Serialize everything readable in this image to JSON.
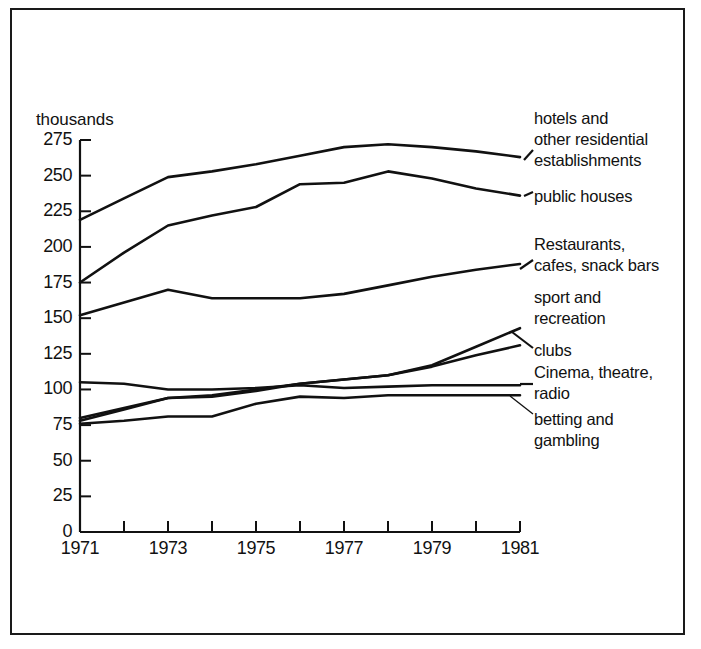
{
  "figure": {
    "axis_unit_label": "thousands",
    "line_color": "#111111",
    "background_color": "#ffffff",
    "frame_color": "#1a1a1a"
  },
  "axes": {
    "y_ticks": [
      "275",
      "250",
      "225",
      "200",
      "175",
      "150",
      "125",
      "100",
      "75",
      "50",
      "25",
      "0"
    ],
    "x_ticks_labeled": [
      "1971",
      "1973",
      "1975",
      "1977",
      "1979",
      "1981"
    ]
  },
  "series_labels": [
    {
      "id": "hotels",
      "lines": [
        "hotels and",
        "other residential",
        "establishments"
      ]
    },
    {
      "id": "public-houses",
      "lines": [
        "public houses"
      ]
    },
    {
      "id": "restaurants",
      "lines": [
        "Restaurants,",
        "cafes, snack bars"
      ]
    },
    {
      "id": "sport",
      "lines": [
        "sport and",
        "recreation"
      ]
    },
    {
      "id": "clubs",
      "lines": [
        "clubs"
      ]
    },
    {
      "id": "cinema",
      "lines": [
        "Cinema, theatre,",
        "radio"
      ]
    },
    {
      "id": "betting",
      "lines": [
        "betting and",
        "gambling"
      ]
    }
  ],
  "chart_data": {
    "type": "line",
    "title": "",
    "subtitle": "",
    "xlabel": "",
    "ylabel": "thousands",
    "x": [
      1971,
      1972,
      1973,
      1974,
      1975,
      1976,
      1977,
      1978,
      1979,
      1980,
      1981
    ],
    "xlim": [
      1971,
      1981
    ],
    "ylim": [
      0,
      275
    ],
    "y_ticks": [
      0,
      25,
      50,
      75,
      100,
      125,
      150,
      175,
      200,
      225,
      250,
      275
    ],
    "x_tick_labels": [
      "1971",
      "",
      "1973",
      "",
      "1975",
      "",
      "1977",
      "",
      "1979",
      "",
      "1981"
    ],
    "grid": false,
    "legend": "right-inline-labels",
    "series": [
      {
        "name": "hotels and other residential establishments",
        "values": [
          219,
          234,
          249,
          253,
          258,
          264,
          270,
          272,
          270,
          267,
          263
        ]
      },
      {
        "name": "public houses",
        "values": [
          175,
          196,
          215,
          222,
          228,
          244,
          245,
          253,
          248,
          241,
          236
        ]
      },
      {
        "name": "Restaurants, cafes, snack bars",
        "values": [
          152,
          161,
          170,
          164,
          164,
          164,
          167,
          173,
          179,
          184,
          188
        ]
      },
      {
        "name": "sport and recreation",
        "values": [
          80,
          87,
          94,
          96,
          100,
          104,
          107,
          110,
          117,
          130,
          143
        ]
      },
      {
        "name": "clubs",
        "values": [
          78,
          86,
          94,
          95,
          99,
          104,
          107,
          110,
          116,
          124,
          131
        ]
      },
      {
        "name": "Cinema, theatre, radio",
        "values": [
          105,
          104,
          100,
          100,
          101,
          103,
          101,
          102,
          103,
          103,
          103
        ]
      },
      {
        "name": "betting and gambling",
        "values": [
          76,
          78,
          81,
          81,
          90,
          95,
          94,
          96,
          96,
          96,
          96
        ]
      }
    ]
  }
}
